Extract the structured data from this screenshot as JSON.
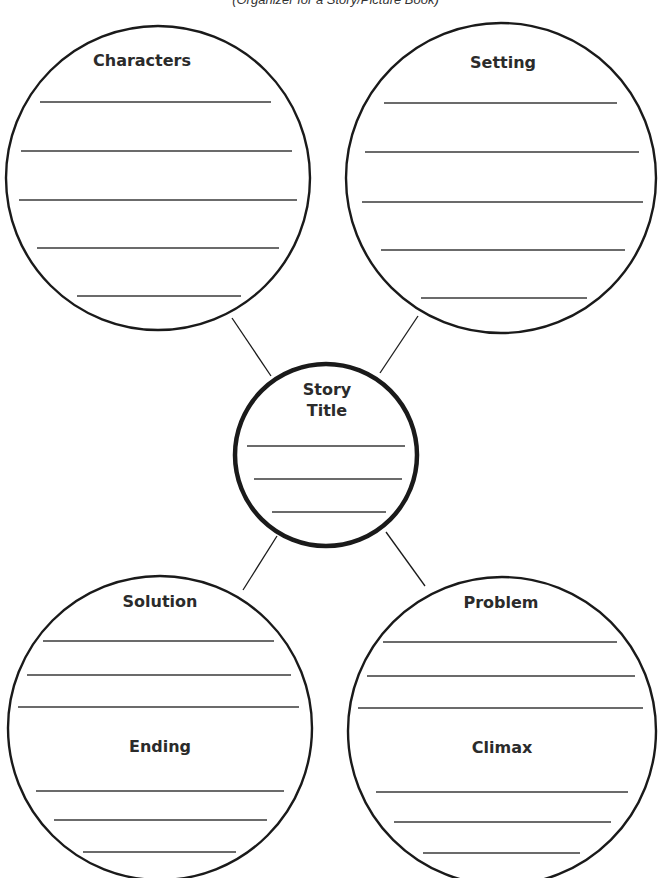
{
  "document": {
    "subtitle": "(Organizer for a Story/Picture Book)"
  },
  "organizer": {
    "center": {
      "title_line1": "Story",
      "title_line2": "Title",
      "blank_lines": 3
    },
    "bubbles": [
      {
        "id": "characters",
        "heading": "Characters",
        "blank_lines": 5
      },
      {
        "id": "setting",
        "heading": "Setting",
        "blank_lines": 5
      },
      {
        "id": "solution",
        "heading": "Solution",
        "blank_lines": 3,
        "sub_heading": "Ending",
        "sub_blank_lines": 3
      },
      {
        "id": "problem",
        "heading": "Problem",
        "blank_lines": 3,
        "sub_heading": "Climax",
        "sub_blank_lines": 3
      }
    ]
  },
  "colors": {
    "stroke": "#1a1a1a",
    "rule": "#3a3a3a",
    "text": "#2b2b2b",
    "background": "#ffffff"
  }
}
